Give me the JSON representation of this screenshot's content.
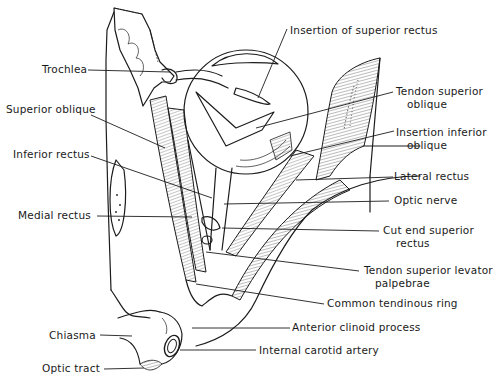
{
  "figure": {
    "labels": {
      "insertion_superior_rectus": "Insertion of superior rectus",
      "trochlea": "Trochlea",
      "tendon_superior_oblique_1": "Tendon superior",
      "tendon_superior_oblique_2": "oblique",
      "superior_oblique": "Superior oblique",
      "insertion_inferior_oblique_1": "Insertion inferior",
      "insertion_inferior_oblique_2": "oblique",
      "inferior_rectus": "Inferior rectus",
      "lateral_rectus": "Lateral rectus",
      "optic_nerve": "Optic nerve",
      "medial_rectus": "Medial rectus",
      "cut_end_superior_rectus_1": "Cut end superior",
      "cut_end_superior_rectus_2": "rectus",
      "tendon_superior_levator_1": "Tendon superior levator",
      "tendon_superior_levator_2": "palpebrae",
      "common_tendinous_ring": "Common tendinous ring",
      "anterior_clinoid_process": "Anterior clinoid process",
      "chiasma": "Chiasma",
      "internal_carotid_artery": "Internal carotid artery",
      "optic_tract": "Optic tract"
    }
  }
}
